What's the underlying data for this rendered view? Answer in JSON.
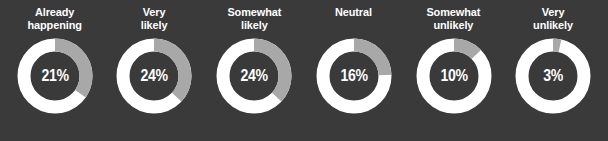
{
  "background_color": "#3a3a3a",
  "ring_color": "#ffffff",
  "arc_color": "#a8a8a8",
  "label_color": "#ffffff",
  "value_color": "#ffffff",
  "chart_data": {
    "type": "pie",
    "title": "",
    "subtitle": "",
    "xlabel": "",
    "ylabel": "",
    "legend": [],
    "grid": false,
    "variant": "donut-row",
    "units": "%",
    "categories": [
      "Already happening",
      "Very likely",
      "Somewhat likely",
      "Neutral",
      "Somewhat unlikely",
      "Very unlikely"
    ],
    "values": [
      21,
      24,
      24,
      16,
      10,
      3
    ],
    "value_labels": [
      "21%",
      "24%",
      "24%",
      "16%",
      "10%",
      "3%"
    ],
    "arc_sweep_degrees": [
      125,
      133,
      133,
      88,
      46,
      13
    ],
    "series": [
      {
        "name": "Share of respondents",
        "values": [
          21,
          24,
          24,
          16,
          10,
          3
        ]
      }
    ]
  },
  "donuts": [
    {
      "label": "Already\nhappening",
      "value_label": "21%",
      "value": 21,
      "sweep": 125
    },
    {
      "label": "Very\nlikely",
      "value_label": "24%",
      "value": 24,
      "sweep": 133
    },
    {
      "label": "Somewhat\nlikely",
      "value_label": "24%",
      "value": 24,
      "sweep": 133
    },
    {
      "label": "Neutral",
      "value_label": "16%",
      "value": 16,
      "sweep": 88
    },
    {
      "label": "Somewhat\nunlikely",
      "value_label": "10%",
      "value": 10,
      "sweep": 46
    },
    {
      "label": "Very\nunlikely",
      "value_label": "3%",
      "value": 3,
      "sweep": 13
    }
  ]
}
